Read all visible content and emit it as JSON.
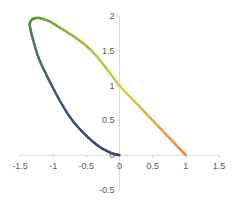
{
  "chart_data": {
    "type": "line",
    "title": "",
    "xlabel": "",
    "ylabel": "",
    "xlim": [
      -1.5,
      1.5
    ],
    "ylim": [
      -0.5,
      2
    ],
    "x_ticks": [
      -1.5,
      -1,
      -0.5,
      0,
      0.5,
      1,
      1.5
    ],
    "y_ticks": [
      -0.5,
      0,
      0.5,
      1,
      1.5,
      2
    ],
    "x_tick_labels": [
      "-1.5",
      "-1",
      "-0.5",
      "0",
      "0.5",
      "1",
      "1.5"
    ],
    "y_tick_labels": [
      "-0.5",
      "0",
      "0.5",
      "1",
      "1.5",
      "2"
    ],
    "grid": false,
    "legend": "none",
    "series": [
      {
        "name": "parametric curve",
        "color_gradient": [
          "#e8883a",
          "#d8d040",
          "#8ab43c",
          "#5a9040",
          "#4a6e6a",
          "#3e4a80",
          "#3a3e78"
        ],
        "x": [
          1.0,
          0.75,
          0.5,
          0.25,
          0.0,
          -0.2,
          -0.42,
          -0.65,
          -0.88,
          -1.05,
          -1.2,
          -1.3,
          -1.35,
          -1.34,
          -1.3,
          -1.22,
          -1.1,
          -1.02,
          -0.88,
          -0.71,
          -0.5,
          -0.3,
          -0.12,
          0.0
        ],
        "y": [
          0.0,
          0.25,
          0.5,
          0.75,
          1.0,
          1.25,
          1.5,
          1.68,
          1.82,
          1.92,
          1.97,
          1.96,
          1.9,
          1.8,
          1.65,
          1.4,
          1.15,
          1.0,
          0.75,
          0.5,
          0.28,
          0.12,
          0.03,
          0.0
        ]
      }
    ]
  }
}
